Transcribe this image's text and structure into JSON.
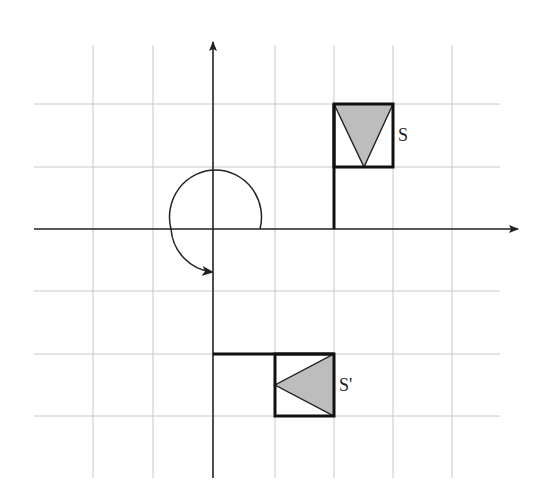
{
  "colors": {
    "grid": "#c8c8c8",
    "axis": "#222222",
    "outline": "#111111",
    "triangle_fill": "#bdbdbd"
  },
  "grid": {
    "unit_px": 61,
    "origin_px": [
      213,
      229
    ],
    "vertical_lines_px": [
      93,
      153,
      213,
      275,
      334,
      393,
      452
    ],
    "horizontal_lines_px": [
      104,
      167,
      229,
      291,
      354,
      416
    ],
    "x_extent_px": [
      34,
      500
    ],
    "y_extent_px": [
      45,
      478
    ]
  },
  "figures": {
    "original": {
      "label": "S",
      "description": "Flag: pole from (2,0) to (2,2), square (2,1)-(3,2) with shaded triangle pointing down"
    },
    "image": {
      "label": "S'",
      "description": "Flag: pole from (0,-2) to (2,-2), square (1,-3)-(2,-2) with shaded triangle pointing left"
    }
  },
  "rotation": {
    "direction": "clockwise",
    "description": "Curved arrow about origin indicating rotation of 270 degrees counter-clockwise / 90 degrees clockwise"
  }
}
